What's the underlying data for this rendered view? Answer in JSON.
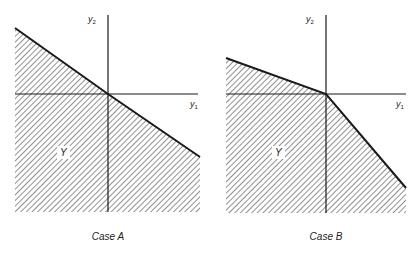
{
  "panels": [
    {
      "id": "case-a",
      "caption": "Case A",
      "region_label": "Y",
      "x_axis_label": "y",
      "x_axis_sub": "1",
      "y_axis_label": "y",
      "y_axis_sub": "2",
      "origin": [
        108,
        94
      ],
      "boundary": [
        [
          15,
          28
        ],
        [
          108,
          94
        ],
        [
          200,
          157
        ]
      ],
      "region_bottom": 212,
      "region_left": 15,
      "region_right": 200,
      "x_axis_extent": [
        15,
        198
      ],
      "y_axis_extent": [
        15,
        212
      ],
      "region_label_pos": [
        60,
        156
      ],
      "y_label_pos": [
        96,
        22
      ],
      "x_label_pos": [
        190,
        107
      ],
      "caption_pos": [
        108,
        240
      ]
    },
    {
      "id": "case-b",
      "caption": "Case B",
      "region_label": "Y",
      "x_axis_label": "y",
      "x_axis_sub": "1",
      "y_axis_label": "y",
      "y_axis_sub": "2",
      "origin": [
        326,
        94
      ],
      "boundary": [
        [
          226,
          58
        ],
        [
          326,
          94
        ],
        [
          406,
          188
        ]
      ],
      "region_bottom": 213,
      "region_left": 226,
      "region_right": 406,
      "x_axis_extent": [
        226,
        406
      ],
      "y_axis_extent": [
        15,
        213
      ],
      "region_label_pos": [
        275,
        156
      ],
      "y_label_pos": [
        314,
        22
      ],
      "x_label_pos": [
        396,
        107
      ],
      "caption_pos": [
        326,
        240
      ]
    }
  ],
  "style": {
    "line_color": "#1a1a1a",
    "hatch_color": "#555555",
    "background": "#ffffff"
  }
}
